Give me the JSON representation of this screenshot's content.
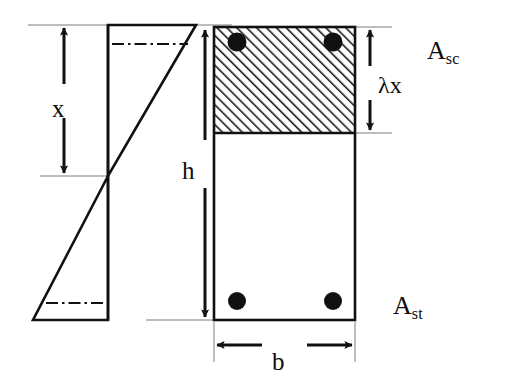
{
  "figure": {
    "background_color": "#ffffff",
    "ink_color": "#111111"
  },
  "labels": {
    "neutral_axis_depth": "x",
    "section_depth": "h",
    "compression_block_depth_lambda": "λx",
    "compression_steel_main": "A",
    "compression_steel_sub": "sc",
    "tension_steel_main": "A",
    "tension_steel_sub": "st",
    "section_width": "b"
  },
  "strain_diagram": {
    "name": "strain-distribution",
    "axis_x": 108,
    "top_y": 25,
    "bottom_y": 320,
    "neutral_axis_y": 176,
    "compression_tip_x": 196,
    "tension_tip_x": 33,
    "dashdot_top_y": 44,
    "dashdot_bottom_y": 303
  },
  "cross_section": {
    "name": "beam-cross-section",
    "left_x": 214,
    "right_x": 355,
    "top_y": 27,
    "bottom_y": 320,
    "compression_block_bottom_y": 133,
    "hatch_angle_deg": 45,
    "rebars": [
      {
        "name": "rebar-top-left",
        "cx": 237,
        "cy": 42,
        "r": 9.5
      },
      {
        "name": "rebar-top-right",
        "cx": 333,
        "cy": 42,
        "r": 9.5
      },
      {
        "name": "rebar-bottom-left",
        "cx": 237,
        "cy": 301,
        "r": 9.0
      },
      {
        "name": "rebar-bottom-right",
        "cx": 333,
        "cy": 301,
        "r": 9.0
      }
    ]
  },
  "dimensions": [
    {
      "name": "dimension-x",
      "orientation": "vertical",
      "from": 25,
      "to": 176,
      "at": 64
    },
    {
      "name": "dimension-h",
      "orientation": "vertical",
      "from": 27,
      "to": 320,
      "at": 205
    },
    {
      "name": "dimension-lambda-x",
      "orientation": "vertical",
      "from": 27,
      "to": 133,
      "at": 370
    },
    {
      "name": "dimension-b",
      "orientation": "horizontal",
      "from": 214,
      "to": 355,
      "at": 345
    }
  ]
}
